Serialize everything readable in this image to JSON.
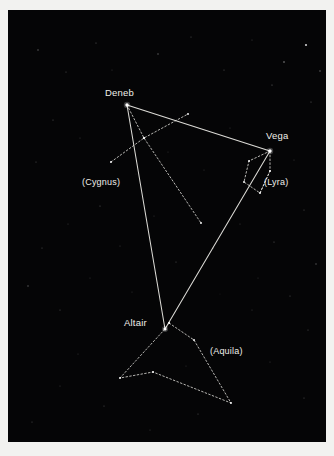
{
  "figure": {
    "name": "summer-triangle-star-chart",
    "background_color": "#f2f2f0",
    "sky_color": "#050506",
    "line_color": "#e8e7e1",
    "label_color": "#f0efe9"
  },
  "stars": [
    {
      "id": "deneb",
      "label": "Deneb",
      "x": 119,
      "y": 95,
      "magnitude_size": 3.4,
      "label_x": 97,
      "label_y": 78
    },
    {
      "id": "vega",
      "label": "Vega",
      "x": 262,
      "y": 141,
      "magnitude_size": 3.4,
      "label_x": 258,
      "label_y": 121
    },
    {
      "id": "altair",
      "label": "Altair",
      "x": 157,
      "y": 319,
      "magnitude_size": 3.2,
      "label_x": 116,
      "label_y": 308
    }
  ],
  "constellation_labels": [
    {
      "id": "cygnus",
      "label": "(Cygnus)",
      "x": 74,
      "y": 168
    },
    {
      "id": "lyra",
      "label": "(Lyra)",
      "x": 256,
      "y": 168
    },
    {
      "id": "aquila",
      "label": "(Aquila)",
      "x": 202,
      "y": 337
    }
  ],
  "chart_data": {
    "type": "scatter",
    "title": "",
    "subtitle": "",
    "xlabel": "",
    "ylabel": "",
    "grid": false,
    "legend": "none",
    "named_stars": [
      {
        "name": "Deneb",
        "constellation": "Cygnus",
        "x": 119,
        "y": 95
      },
      {
        "name": "Vega",
        "constellation": "Lyra",
        "x": 262,
        "y": 141
      },
      {
        "name": "Altair",
        "constellation": "Aquila",
        "x": 157,
        "y": 319
      }
    ],
    "asterism": {
      "name": "Summer Triangle",
      "vertices": [
        "Deneb",
        "Vega",
        "Altair"
      ],
      "line_style": "solid"
    },
    "constellations": [
      {
        "name": "Cygnus",
        "line_style": "dotted"
      },
      {
        "name": "Lyra",
        "line_style": "dotted"
      },
      {
        "name": "Aquila",
        "line_style": "dotted"
      }
    ]
  },
  "geometry": {
    "triangle": [
      [
        119,
        95
      ],
      [
        262,
        141
      ],
      [
        157,
        319
      ]
    ],
    "cygnus_spine": [
      [
        119,
        95
      ],
      [
        136,
        128
      ],
      [
        193,
        213
      ]
    ],
    "cygnus_crossbar": [
      [
        103,
        152
      ],
      [
        136,
        128
      ],
      [
        180,
        104
      ]
    ],
    "lyra_shape": [
      [
        262,
        141
      ],
      [
        241,
        151
      ],
      [
        236,
        172
      ],
      [
        252,
        183
      ],
      [
        262,
        161
      ],
      [
        262,
        141
      ]
    ],
    "lyra_inner": [
      [
        252,
        183
      ],
      [
        262,
        161
      ]
    ],
    "aquila_shape": [
      [
        161,
        313
      ],
      [
        157,
        319
      ],
      [
        112,
        368
      ],
      [
        145,
        362
      ],
      [
        223,
        393
      ],
      [
        186,
        330
      ],
      [
        161,
        313
      ]
    ],
    "background_stars": [
      {
        "x": 298,
        "y": 35,
        "r": 1.1,
        "o": 0.8
      },
      {
        "x": 276,
        "y": 52,
        "r": 0.8,
        "o": 0.55
      },
      {
        "x": 312,
        "y": 61,
        "r": 0.7,
        "o": 0.45
      },
      {
        "x": 264,
        "y": 75,
        "r": 0.6,
        "o": 0.4
      },
      {
        "x": 303,
        "y": 92,
        "r": 0.6,
        "o": 0.35
      },
      {
        "x": 30,
        "y": 40,
        "r": 0.7,
        "o": 0.4
      },
      {
        "x": 58,
        "y": 62,
        "r": 0.6,
        "o": 0.3
      },
      {
        "x": 88,
        "y": 33,
        "r": 0.6,
        "o": 0.35
      },
      {
        "x": 150,
        "y": 44,
        "r": 0.7,
        "o": 0.4
      },
      {
        "x": 183,
        "y": 27,
        "r": 0.6,
        "o": 0.3
      },
      {
        "x": 216,
        "y": 60,
        "r": 0.6,
        "o": 0.32
      },
      {
        "x": 244,
        "y": 30,
        "r": 0.5,
        "o": 0.28
      },
      {
        "x": 45,
        "y": 110,
        "r": 0.6,
        "o": 0.32
      },
      {
        "x": 72,
        "y": 128,
        "r": 0.5,
        "o": 0.26
      },
      {
        "x": 28,
        "y": 152,
        "r": 0.6,
        "o": 0.3
      },
      {
        "x": 92,
        "y": 196,
        "r": 0.6,
        "o": 0.34
      },
      {
        "x": 60,
        "y": 214,
        "r": 0.5,
        "o": 0.26
      },
      {
        "x": 34,
        "y": 238,
        "r": 0.6,
        "o": 0.3
      },
      {
        "x": 20,
        "y": 276,
        "r": 0.7,
        "o": 0.38
      },
      {
        "x": 52,
        "y": 300,
        "r": 0.6,
        "o": 0.3
      },
      {
        "x": 82,
        "y": 268,
        "r": 0.5,
        "o": 0.24
      },
      {
        "x": 112,
        "y": 236,
        "r": 0.5,
        "o": 0.25
      },
      {
        "x": 146,
        "y": 206,
        "r": 0.5,
        "o": 0.24
      },
      {
        "x": 168,
        "y": 252,
        "r": 0.6,
        "o": 0.3
      },
      {
        "x": 205,
        "y": 238,
        "r": 0.6,
        "o": 0.32
      },
      {
        "x": 232,
        "y": 214,
        "r": 0.5,
        "o": 0.26
      },
      {
        "x": 266,
        "y": 232,
        "r": 0.6,
        "o": 0.34
      },
      {
        "x": 296,
        "y": 200,
        "r": 0.6,
        "o": 0.3
      },
      {
        "x": 308,
        "y": 254,
        "r": 0.7,
        "o": 0.36
      },
      {
        "x": 282,
        "y": 286,
        "r": 0.6,
        "o": 0.3
      },
      {
        "x": 244,
        "y": 300,
        "r": 0.5,
        "o": 0.26
      },
      {
        "x": 300,
        "y": 320,
        "r": 0.6,
        "o": 0.3
      },
      {
        "x": 262,
        "y": 352,
        "r": 0.5,
        "o": 0.25
      },
      {
        "x": 296,
        "y": 388,
        "r": 0.6,
        "o": 0.3
      },
      {
        "x": 190,
        "y": 404,
        "r": 0.6,
        "o": 0.3
      },
      {
        "x": 142,
        "y": 420,
        "r": 0.5,
        "o": 0.26
      },
      {
        "x": 96,
        "y": 396,
        "r": 0.6,
        "o": 0.3
      },
      {
        "x": 52,
        "y": 376,
        "r": 0.5,
        "o": 0.25
      },
      {
        "x": 24,
        "y": 412,
        "r": 0.6,
        "o": 0.28
      },
      {
        "x": 70,
        "y": 344,
        "r": 0.5,
        "o": 0.24
      },
      {
        "x": 124,
        "y": 282,
        "r": 0.5,
        "o": 0.22
      },
      {
        "x": 196,
        "y": 160,
        "r": 0.5,
        "o": 0.24
      },
      {
        "x": 222,
        "y": 118,
        "r": 0.5,
        "o": 0.24
      },
      {
        "x": 160,
        "y": 142,
        "r": 0.5,
        "o": 0.22
      },
      {
        "x": 104,
        "y": 60,
        "r": 0.5,
        "o": 0.24
      },
      {
        "x": 250,
        "y": 268,
        "r": 0.5,
        "o": 0.22
      },
      {
        "x": 178,
        "y": 356,
        "r": 0.5,
        "o": 0.22
      },
      {
        "x": 128,
        "y": 164,
        "r": 0.4,
        "o": 0.2
      },
      {
        "x": 212,
        "y": 284,
        "r": 0.4,
        "o": 0.2
      },
      {
        "x": 286,
        "y": 150,
        "r": 0.5,
        "o": 0.26
      }
    ]
  }
}
